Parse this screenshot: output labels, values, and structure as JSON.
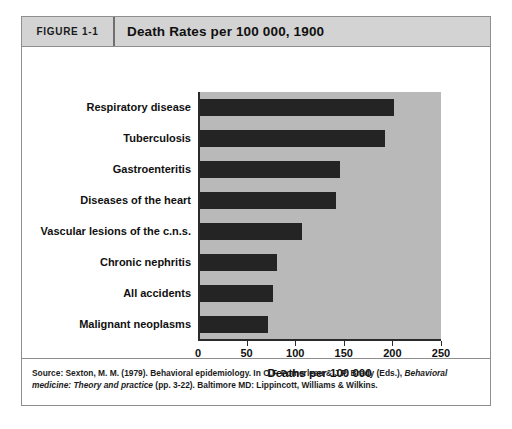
{
  "figure": {
    "number_label": "FIGURE 1-1",
    "title": "Death Rates per 100 000, 1900"
  },
  "source": {
    "prefix": "Source: Sexton, M. M. (1979). Behavioral epidemiology. In O.F. Pomerleau & J.P. Brady (Eds.), ",
    "italic_1": "Behavioral medicine:",
    "italic_2": "Theory and practice",
    "suffix": " (pp. 3-22). Baltimore MD: Lippincott, Williams & Wilkins."
  },
  "colors": {
    "bar": "#242424",
    "plot_background": "#b9b9b9",
    "header_background": "#d3d3d3",
    "frame_border": "#8e8e8e",
    "axis": "#2a2a2a"
  },
  "chart_data": {
    "type": "bar",
    "orientation": "horizontal",
    "title": "Death Rates per 100 000, 1900",
    "xlabel": "Deaths per 100 000",
    "ylabel": "",
    "xlim": [
      0,
      250
    ],
    "xticks": [
      0,
      50,
      100,
      150,
      200,
      250
    ],
    "xtick_labels": [
      "0",
      "50",
      "100",
      "150",
      "200",
      "250"
    ],
    "grid": false,
    "legend": false,
    "categories": [
      "Respiratory disease",
      "Tuberculosis",
      "Gastroenteritis",
      "Diseases of the heart",
      "Vascular lesions of the c.n.s.",
      "Chronic nephritis",
      "All accidents",
      "Malignant neoplasms"
    ],
    "values": [
      200,
      190,
      144,
      140,
      105,
      79,
      75,
      70
    ]
  }
}
